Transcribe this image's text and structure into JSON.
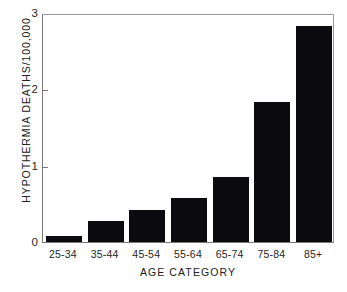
{
  "chart_data": {
    "type": "bar",
    "title": "",
    "xlabel": "AGE  CATEGORY",
    "ylabel": "HYPOTHERMIA  DEATHS/100,000",
    "categories": [
      "25-34",
      "35-44",
      "45-54",
      "55-64",
      "65-74",
      "75-84",
      "85+"
    ],
    "values": [
      0.08,
      0.27,
      0.42,
      0.58,
      0.85,
      1.84,
      2.83
    ],
    "ylim": [
      0,
      3
    ],
    "yticks": [
      0,
      1,
      2,
      3
    ],
    "ytick_labels": [
      "0",
      "1",
      "2",
      "3"
    ],
    "grid": false,
    "legend": null,
    "bar_color": "#0a0a0f",
    "axis_color": "#7a7a7a",
    "background": "#ffffff"
  }
}
